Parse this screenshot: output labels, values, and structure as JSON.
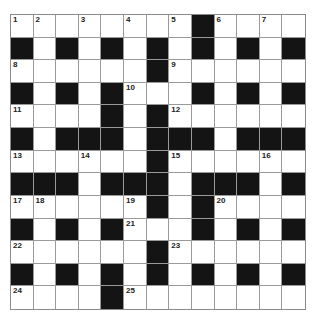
{
  "header": {
    "title": ""
  },
  "puzzle": {
    "type": "crossword",
    "rows": 13,
    "cols": 13,
    "colors": {
      "block": "#141414",
      "cell": "#ffffff",
      "gridline": "#9a9a9a"
    },
    "grid": [
      "........#....",
      "#.#.#.#.#.#.#",
      "......#......",
      "#.#.#...#.#.#",
      "....#.#......",
      "#.###.###.###",
      "......#......",
      "###.###.###.#",
      "......#.#....",
      "#.#.#...#.#.#",
      "......#......",
      "#.#.#.#.#.#.#",
      "....#........"
    ],
    "numbers": [
      {
        "r": 0,
        "c": 0,
        "n": "1"
      },
      {
        "r": 0,
        "c": 1,
        "n": "2"
      },
      {
        "r": 0,
        "c": 3,
        "n": "3"
      },
      {
        "r": 0,
        "c": 5,
        "n": "4"
      },
      {
        "r": 0,
        "c": 7,
        "n": "5"
      },
      {
        "r": 0,
        "c": 9,
        "n": "6"
      },
      {
        "r": 0,
        "c": 11,
        "n": "7"
      },
      {
        "r": 2,
        "c": 0,
        "n": "8"
      },
      {
        "r": 2,
        "c": 7,
        "n": "9"
      },
      {
        "r": 3,
        "c": 5,
        "n": "10"
      },
      {
        "r": 4,
        "c": 0,
        "n": "11"
      },
      {
        "r": 4,
        "c": 7,
        "n": "12"
      },
      {
        "r": 6,
        "c": 0,
        "n": "13"
      },
      {
        "r": 6,
        "c": 3,
        "n": "14"
      },
      {
        "r": 6,
        "c": 7,
        "n": "15"
      },
      {
        "r": 6,
        "c": 11,
        "n": "16"
      },
      {
        "r": 8,
        "c": 0,
        "n": "17"
      },
      {
        "r": 8,
        "c": 1,
        "n": "18"
      },
      {
        "r": 8,
        "c": 5,
        "n": "19"
      },
      {
        "r": 8,
        "c": 9,
        "n": "20"
      },
      {
        "r": 9,
        "c": 5,
        "n": "21"
      },
      {
        "r": 10,
        "c": 0,
        "n": "22"
      },
      {
        "r": 10,
        "c": 7,
        "n": "23"
      },
      {
        "r": 12,
        "c": 0,
        "n": "24"
      },
      {
        "r": 12,
        "c": 5,
        "n": "25"
      }
    ]
  }
}
